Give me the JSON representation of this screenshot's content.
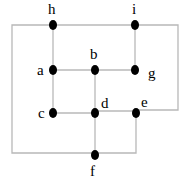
{
  "diagram": {
    "type": "graph",
    "colors": {
      "edge": "#b8b8b8",
      "node": "#000000",
      "label": "#000000",
      "background": "#ffffff"
    },
    "nodes": [
      {
        "id": "h",
        "label": "h"
      },
      {
        "id": "i",
        "label": "i"
      },
      {
        "id": "a",
        "label": "a"
      },
      {
        "id": "b",
        "label": "b"
      },
      {
        "id": "g",
        "label": "g"
      },
      {
        "id": "c",
        "label": "c"
      },
      {
        "id": "d",
        "label": "d"
      },
      {
        "id": "e",
        "label": "e"
      },
      {
        "id": "f",
        "label": "f"
      }
    ],
    "edges": [
      [
        "h",
        "i"
      ],
      [
        "h",
        "a"
      ],
      [
        "i",
        "g"
      ],
      [
        "a",
        "b"
      ],
      [
        "b",
        "g"
      ],
      [
        "a",
        "c"
      ],
      [
        "b",
        "d"
      ],
      [
        "c",
        "d"
      ],
      [
        "d",
        "e"
      ],
      [
        "d",
        "f"
      ],
      [
        "e",
        "f"
      ],
      [
        "h",
        "f"
      ],
      [
        "i",
        "e"
      ]
    ]
  }
}
